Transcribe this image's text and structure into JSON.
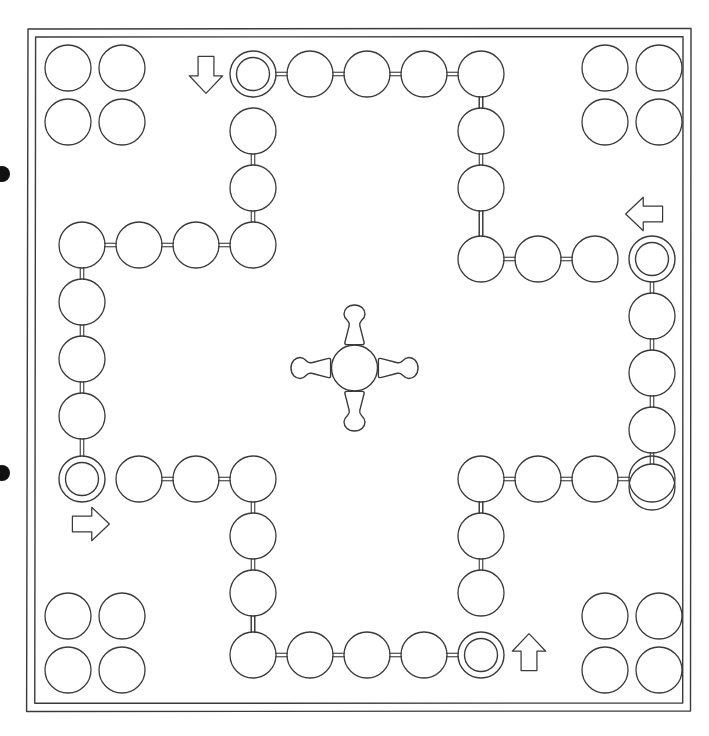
{
  "diagram": {
    "subtitle": "Ludo / Parcheesi style race board",
    "type": "line-drawing",
    "background_color": "#ffffff",
    "ink_color": "#3a3a3a",
    "dot_color": "#111111"
  },
  "board": {
    "frame": {
      "outer": {
        "x": 27,
        "y": 29,
        "width": 664,
        "height": 682
      },
      "inner": {
        "x": 35,
        "y": 37,
        "width": 648,
        "height": 666
      },
      "stroke_width": 1.4,
      "line_count": 2
    },
    "space_radius": 23,
    "ring_outer_radius": 23,
    "ring_inner_radius": 16.5,
    "connector_style": "double-line",
    "connector_gap": 3.5
  },
  "center": {
    "hub": {
      "cx": 354.5,
      "cy": 368,
      "r": 23,
      "label": "home-circle"
    },
    "pawns": [
      {
        "id": "pawn-top",
        "direction": "down",
        "cx": 354.5,
        "cy": 325,
        "label": "pawn pointing to center from top"
      },
      {
        "id": "pawn-right",
        "direction": "left",
        "cx": 398,
        "cy": 368,
        "label": "pawn pointing to center from right"
      },
      {
        "id": "pawn-bottom",
        "direction": "up",
        "cx": 354.5,
        "cy": 411,
        "label": "pawn pointing to center from bottom"
      },
      {
        "id": "pawn-left",
        "direction": "right",
        "cx": 311,
        "cy": 368,
        "label": "pawn pointing to center from left"
      }
    ]
  },
  "tracks": {
    "top_outer_row": {
      "y": 74,
      "xs": [
        253,
        310,
        367,
        424,
        481
      ],
      "start_index": 0,
      "count": 5
    },
    "top_column": {
      "x": 253,
      "ys": [
        131,
        188,
        245
      ],
      "count": 3
    },
    "top_inner_row": {
      "y": 245,
      "xs": [
        82,
        139,
        196,
        253
      ],
      "count": 4
    },
    "right_outer_col": {
      "x": 652,
      "ys": [
        259,
        316,
        373,
        430,
        487
      ],
      "start_index": 0,
      "count": 5
    },
    "right_row": {
      "y": 259,
      "xs": [
        481,
        538,
        595
      ],
      "count": 3
    },
    "right_inner_col": {
      "x": 481,
      "ys": [
        74,
        131,
        188,
        259
      ],
      "count": 4
    },
    "left_outer_col": {
      "x": 82,
      "ys": [
        245,
        302,
        359,
        416,
        479
      ],
      "start_index": 4,
      "count": 5
    },
    "left_row": {
      "y": 479,
      "xs": [
        139,
        196,
        253
      ],
      "count": 3
    },
    "left_inner_col": {
      "x": 253,
      "ys": [
        479,
        536,
        593,
        655
      ],
      "count": 4
    },
    "bottom_outer_row": {
      "y": 655,
      "xs": [
        253,
        310,
        367,
        424,
        481
      ],
      "start_index": 4,
      "count": 5
    },
    "bottom_column": {
      "x": 481,
      "ys": [
        479,
        536,
        593
      ],
      "count": 3
    },
    "bottom_inner_row": {
      "y": 479,
      "xs": [
        481,
        538,
        595,
        652
      ],
      "count": 4
    }
  },
  "start_spaces": [
    {
      "id": "start-top",
      "cx": 253,
      "cy": 74,
      "marker": "double-ring",
      "arrow_direction": "down",
      "arrow_cx": 206,
      "arrow_cy": 74
    },
    {
      "id": "start-right",
      "cx": 652,
      "cy": 259,
      "marker": "double-ring",
      "arrow_direction": "left",
      "arrow_cx": 645,
      "arrow_cy": 214
    },
    {
      "id": "start-left",
      "cx": 82,
      "cy": 479,
      "marker": "double-ring",
      "arrow_direction": "right",
      "arrow_cx": 90,
      "arrow_cy": 524
    },
    {
      "id": "start-bottom",
      "cx": 481,
      "cy": 655,
      "marker": "double-ring",
      "arrow_direction": "up",
      "arrow_cx": 529,
      "arrow_cy": 653
    }
  ],
  "home_yards": [
    {
      "id": "home-top-left",
      "corner": "top-left",
      "cols": [
        68,
        122
      ],
      "rows": [
        68,
        122
      ],
      "count": 4
    },
    {
      "id": "home-top-right",
      "corner": "top-right",
      "cols": [
        605,
        659
      ],
      "rows": [
        68,
        122
      ],
      "count": 4
    },
    {
      "id": "home-bottom-left",
      "corner": "bottom-left",
      "cols": [
        68,
        122
      ],
      "rows": [
        616,
        670
      ],
      "count": 4
    },
    {
      "id": "home-bottom-right",
      "corner": "bottom-right",
      "cols": [
        605,
        659
      ],
      "rows": [
        616,
        670
      ],
      "count": 4
    }
  ],
  "page_marks": {
    "label": "scan binding dots",
    "dots": [
      {
        "id": "edge-dot-upper",
        "cx": 2,
        "cy": 174,
        "r": 8
      },
      {
        "id": "edge-dot-lower",
        "cx": 2,
        "cy": 473,
        "r": 8
      }
    ]
  },
  "counts": {
    "total_track_spaces": 48,
    "home_yard_spaces": 16,
    "start_spaces": 4,
    "arrows": 4,
    "center_pawns": 4
  }
}
